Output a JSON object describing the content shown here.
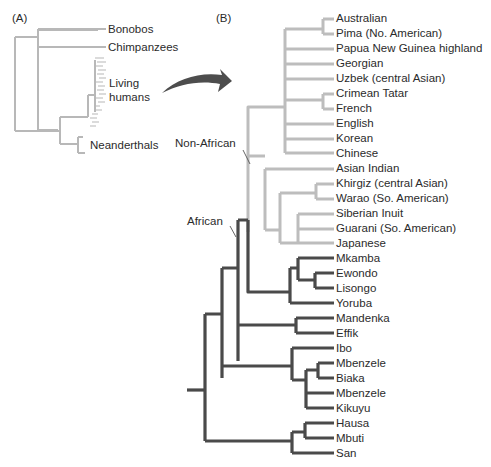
{
  "panel_a": {
    "label": "(A)",
    "taxa": [
      "Bonobos",
      "Chimpanzees",
      "Living humans",
      "Neanderthals"
    ],
    "living_line1": "Living",
    "living_line2": "humans"
  },
  "panel_b": {
    "label": "(B)",
    "group_labels": {
      "non_african": "Non-African",
      "african": "African"
    },
    "leaves": [
      "Australian",
      "Pima (No. American)",
      "Papua New Guinea highland",
      "Georgian",
      "Uzbek (central Asian)",
      "Crimean Tatar",
      "French",
      "English",
      "Korean",
      "Chinese",
      "Asian Indian",
      "Khirgiz (central Asian)",
      "Warao (So. American)",
      "Siberian Inuit",
      "Guarani (So. American)",
      "Japanese",
      "Mkamba",
      "Ewondo",
      "Lisongo",
      "Yoruba",
      "Mandenka",
      "Effik",
      "Ibo",
      "Mbenzele",
      "Biaka",
      "Mbenzele",
      "Kikuyu",
      "Hausa",
      "Mbuti",
      "San"
    ]
  },
  "colors": {
    "non_african": "#bdbdbd",
    "african": "#4a4a4a",
    "arrow": "#4d4d4d"
  }
}
